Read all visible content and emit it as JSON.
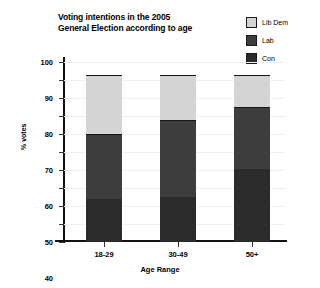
{
  "chart_data": {
    "type": "bar",
    "subtype": "stacked-bar",
    "title": "Voting intentions in the 2005\nGeneral Election according to age",
    "xlabel": "Age Range",
    "ylabel": "% votes",
    "categories": [
      "18-29",
      "30-49",
      "50+"
    ],
    "ylim": [
      0,
      100
    ],
    "yticks": [
      0,
      10,
      20,
      30,
      40,
      50,
      60,
      70,
      80,
      90,
      100
    ],
    "ytick_labels": [
      "0",
      "10",
      "20",
      "30",
      "40",
      "50",
      "60",
      "70",
      "80",
      "90",
      "100"
    ],
    "grid": true,
    "legend_position": "top-right",
    "series": [
      {
        "name": "Con",
        "color": "#2b2b2b",
        "values": [
          24,
          25,
          41
        ]
      },
      {
        "name": "Lab",
        "color": "#3d3d3d",
        "values": [
          36,
          43,
          34
        ]
      },
      {
        "name": "Lib Dem",
        "color": "#d4d4d4",
        "values": [
          33,
          25,
          18
        ]
      }
    ],
    "stack_tops": {
      "Con": [
        24,
        25,
        41
      ],
      "Lab": [
        60,
        68,
        75
      ],
      "Lib Dem": [
        93,
        93,
        93
      ]
    },
    "legend": [
      {
        "label": "Lib Dem",
        "color": "#d4d4d4"
      },
      {
        "label": "Lab",
        "color": "#3d3d3d"
      },
      {
        "label": "Con",
        "color": "#2b2b2b"
      }
    ]
  }
}
